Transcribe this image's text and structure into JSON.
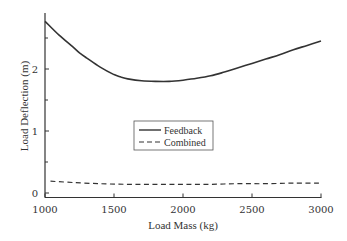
{
  "chart_data": {
    "type": "line",
    "title": "",
    "xlabel": "Load Mass (kg)",
    "ylabel": "Load Deflection (m)",
    "xlim": [
      1000,
      3000
    ],
    "ylim": [
      -0.07,
      2.95
    ],
    "xticks": [
      "1000",
      "1500",
      "2000",
      "2500",
      "3000"
    ],
    "yticks": [
      "0",
      "1",
      "2"
    ],
    "yminor_ticks": [
      0.5,
      1.5,
      2.5
    ],
    "grid": false,
    "legend_position": "center",
    "series": [
      {
        "name": "Feedback",
        "style": "solid",
        "x": [
          1000,
          1100,
          1200,
          1250,
          1300,
          1400,
          1500,
          1550,
          1600,
          1700,
          1800,
          1900,
          2000,
          2100,
          2200,
          2300,
          2400,
          2500,
          2600,
          2700,
          2800,
          2900,
          3000
        ],
        "y": [
          2.77,
          2.55,
          2.36,
          2.26,
          2.18,
          2.03,
          1.91,
          1.87,
          1.84,
          1.81,
          1.8,
          1.8,
          1.82,
          1.85,
          1.89,
          1.95,
          2.02,
          2.09,
          2.16,
          2.23,
          2.31,
          2.38,
          2.45
        ]
      },
      {
        "name": "Combined",
        "style": "dashed",
        "x": [
          1040,
          1200,
          1400,
          1600,
          1800,
          2000,
          2200,
          2400,
          2600,
          2800,
          3000
        ],
        "y": [
          0.19,
          0.17,
          0.15,
          0.14,
          0.14,
          0.14,
          0.14,
          0.15,
          0.15,
          0.16,
          0.16
        ]
      }
    ]
  },
  "legend": {
    "items": [
      {
        "label": "Feedback",
        "style": "solid"
      },
      {
        "label": "Combined",
        "style": "dashed"
      }
    ]
  },
  "colors": {
    "line": "#333333",
    "axis": "#333333",
    "background": "#ffffff"
  }
}
